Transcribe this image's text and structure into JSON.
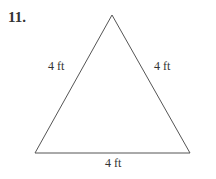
{
  "problem": {
    "number": "11."
  },
  "figure": {
    "shape": "equilateral-triangle",
    "stroke_color": "#555555",
    "vertices": {
      "apex": [
        112,
        15
      ],
      "bottom_left": [
        35,
        153
      ],
      "bottom_right": [
        190,
        153
      ]
    },
    "labels": {
      "left_side": "4 ft",
      "right_side": "4 ft",
      "bottom_side": "4 ft"
    }
  }
}
